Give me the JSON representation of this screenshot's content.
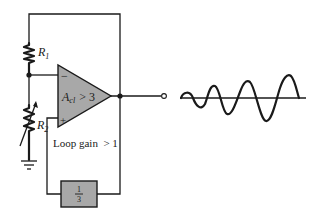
{
  "diagram": {
    "type": "oscillator-startup-circuit",
    "components": {
      "resistor_1": {
        "label": "R",
        "subscript": "1"
      },
      "resistor_2": {
        "label": "R",
        "subscript": "2",
        "variable": true
      },
      "op_amp": {
        "gain_label": "A",
        "gain_subscript": "cl",
        "gain_condition": "> 3",
        "inverting_input": "−",
        "noninverting_input": "+"
      },
      "feedback_network": {
        "numerator": "1",
        "denominator": "3"
      },
      "ground": {
        "label": "ground"
      }
    },
    "annotation": "Loop gain  > 1",
    "output_waveform": {
      "description": "growing sinusoidal oscillation"
    },
    "colors": {
      "line": "#1a1a1a",
      "opamp_fill": "#a8a8a8",
      "box_fill": "#a8a8a8",
      "background": "#ffffff"
    }
  }
}
